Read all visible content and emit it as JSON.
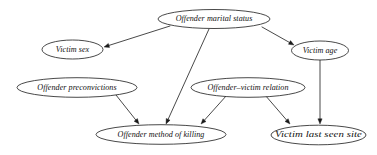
{
  "diagram": {
    "type": "directed-acyclic-graph",
    "background_color": "#ffffff",
    "stroke_color": "#1a1a1a",
    "text_color": "#111111",
    "font_style": "italic-serif",
    "nodes": [
      {
        "id": "offender_marital_status",
        "label": "Offender marital status",
        "cx": 214,
        "cy": 19,
        "rx": 56,
        "ry": 9.5
      },
      {
        "id": "victim_sex",
        "label": "Victim sex",
        "cx": 72.5,
        "cy": 49.5,
        "rx": 30.5,
        "ry": 9.5
      },
      {
        "id": "victim_age",
        "label": "Victim age",
        "cx": 320,
        "cy": 50.5,
        "rx": 28.5,
        "ry": 9.5
      },
      {
        "id": "offender_preconvictions",
        "label": "Offender preconvictions",
        "cx": 77,
        "cy": 87.5,
        "rx": 60,
        "ry": 9.8
      },
      {
        "id": "offender_victim_relation",
        "label": "Offender–victim relation",
        "cx": 248,
        "cy": 87.5,
        "rx": 57,
        "ry": 9.8
      },
      {
        "id": "offender_method_of_killing",
        "label": "Offender method of killing",
        "cx": 161,
        "cy": 134.5,
        "rx": 65,
        "ry": 9.8
      },
      {
        "id": "victim_last_seen_site",
        "label": "Victim last seen site",
        "cx": 318.5,
        "cy": 135,
        "rx": 47.5,
        "ry": 9.8
      }
    ],
    "edges": [
      {
        "id": "marital-to-victim-sex",
        "from": "offender_marital_status",
        "to": "victim_sex",
        "x1": 170,
        "y1": 26,
        "x2": 104,
        "y2": 47
      },
      {
        "id": "marital-to-method-of-killing",
        "from": "offender_marital_status",
        "to": "offender_method_of_killing",
        "x1": 209,
        "y1": 29,
        "x2": 166,
        "y2": 124
      },
      {
        "id": "marital-to-victim-age",
        "from": "offender_marital_status",
        "to": "victim_age",
        "x1": 262,
        "y1": 27,
        "x2": 294,
        "y2": 45
      },
      {
        "id": "preconvictions-to-method-of-killing",
        "from": "offender_preconvictions",
        "to": "offender_method_of_killing",
        "x1": 116,
        "y1": 95,
        "x2": 139,
        "y2": 124
      },
      {
        "id": "relation-to-method-of-killing",
        "from": "offender_victim_relation",
        "to": "offender_method_of_killing",
        "x1": 227,
        "y1": 95,
        "x2": 201,
        "y2": 124
      },
      {
        "id": "relation-to-last-seen-site",
        "from": "offender_victim_relation",
        "to": "victim_last_seen_site",
        "x1": 265,
        "y1": 95,
        "x2": 290,
        "y2": 124
      },
      {
        "id": "victim-age-to-last-seen-site",
        "from": "victim_age",
        "to": "victim_last_seen_site",
        "x1": 320,
        "y1": 60,
        "x2": 320,
        "y2": 124
      }
    ]
  }
}
